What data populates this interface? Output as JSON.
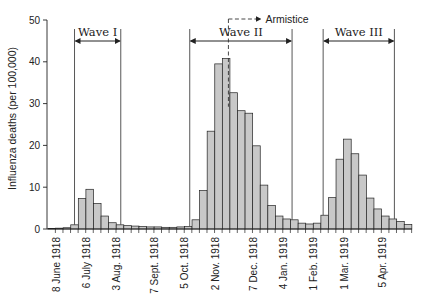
{
  "chart_data": {
    "type": "bar",
    "title": "",
    "xlabel": "",
    "ylabel": "Influenza deaths (per 100,000)",
    "ylim": [
      0,
      50
    ],
    "yticks": [
      0,
      10,
      20,
      30,
      40,
      50
    ],
    "grid": false,
    "bar_color": "#c8c8c8",
    "bar_edge_color": "#222222",
    "x_tick_labels": [
      "8 June 1918",
      "6 July 1918",
      "3 Aug. 1918",
      "7 Sept. 1918",
      "5 Oct. 1918",
      "2 Nov. 1918",
      "7 Dec. 1918",
      "4 Jan. 1919",
      "1 Feb. 1919",
      "1 Mar. 1919",
      "5 Apr. 1919"
    ],
    "x_tick_label_bar_index": [
      1,
      5,
      9,
      14,
      18,
      22,
      27,
      31,
      35,
      39,
      44
    ],
    "values": [
      0.1,
      0.2,
      0.3,
      1.0,
      7.3,
      9.5,
      6.1,
      3.1,
      1.5,
      1.0,
      0.8,
      0.7,
      0.6,
      0.5,
      0.5,
      0.4,
      0.4,
      0.5,
      0.6,
      2.2,
      9.2,
      23.4,
      39.5,
      40.8,
      32.6,
      28.3,
      27.7,
      19.9,
      10.5,
      5.6,
      3.1,
      2.4,
      2.2,
      1.4,
      1.2,
      1.4,
      3.3,
      7.5,
      16.7,
      21.5,
      18.0,
      12.9,
      7.4,
      4.8,
      3.1,
      2.4,
      1.8,
      1.1
    ],
    "annotations": [
      {
        "label": "Wave I",
        "start_bar": 3.5,
        "end_bar": 9.6
      },
      {
        "label": "Wave II",
        "start_bar": 18.7,
        "end_bar": 32.2
      },
      {
        "label": "Wave III",
        "start_bar": 36.3,
        "end_bar": 45.7
      },
      {
        "label": "Armistice",
        "bar": 24,
        "style": "dashed-arrow"
      }
    ]
  }
}
